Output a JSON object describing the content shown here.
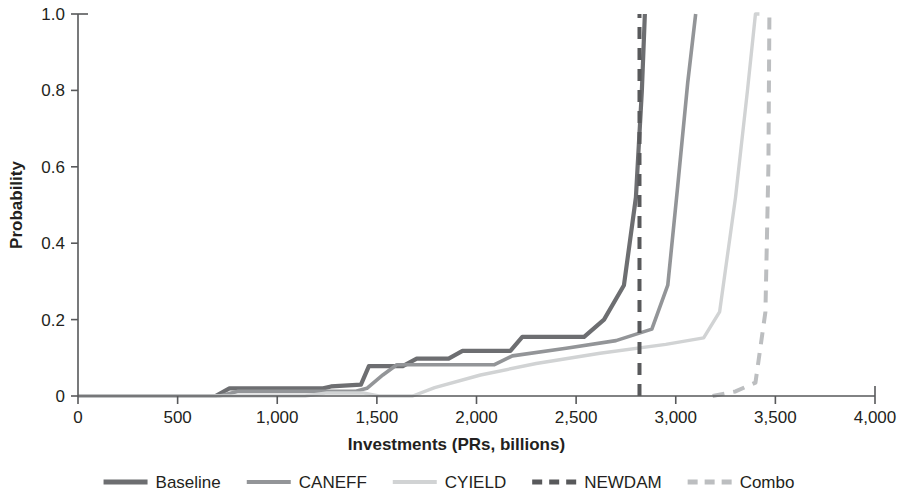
{
  "chart_data": {
    "type": "line",
    "title": "",
    "xlabel": "Investments (PRs, billions)",
    "ylabel": "Probability",
    "xlim": [
      0,
      4000
    ],
    "ylim": [
      0,
      1.0
    ],
    "grid": false,
    "legend_position": "bottom",
    "x_ticks": [
      0,
      500,
      1000,
      1500,
      2000,
      2500,
      3000,
      3500,
      4000
    ],
    "x_tick_labels": [
      "0",
      "500",
      "1,000",
      "1,500",
      "2,000",
      "2,500",
      "3,000",
      "3,500",
      "4,000"
    ],
    "y_ticks": [
      0,
      0.2,
      0.4,
      0.6,
      0.8,
      1.0
    ],
    "y_tick_labels": [
      "0",
      "0.2",
      "0.4",
      "0.6",
      "0.8",
      "1.0"
    ],
    "series": [
      {
        "name": "Baseline",
        "color": "#6d6e71",
        "width": 4.2,
        "dash": "none",
        "points": [
          [
            0,
            0.0
          ],
          [
            690,
            0.0
          ],
          [
            760,
            0.02
          ],
          [
            1230,
            0.02
          ],
          [
            1270,
            0.025
          ],
          [
            1420,
            0.03
          ],
          [
            1460,
            0.078
          ],
          [
            1630,
            0.078
          ],
          [
            1700,
            0.098
          ],
          [
            1860,
            0.098
          ],
          [
            1930,
            0.118
          ],
          [
            2170,
            0.118
          ],
          [
            2230,
            0.155
          ],
          [
            2540,
            0.155
          ],
          [
            2640,
            0.2
          ],
          [
            2740,
            0.29
          ],
          [
            2800,
            0.52
          ],
          [
            2830,
            0.8
          ],
          [
            2845,
            1.0
          ]
        ]
      },
      {
        "name": "CANEFF",
        "color": "#939598",
        "width": 3.6,
        "dash": "none",
        "points": [
          [
            0,
            0.0
          ],
          [
            710,
            0.0
          ],
          [
            800,
            0.012
          ],
          [
            1390,
            0.012
          ],
          [
            1450,
            0.02
          ],
          [
            1530,
            0.055
          ],
          [
            1600,
            0.082
          ],
          [
            2090,
            0.082
          ],
          [
            2180,
            0.105
          ],
          [
            2450,
            0.125
          ],
          [
            2700,
            0.145
          ],
          [
            2880,
            0.175
          ],
          [
            2960,
            0.29
          ],
          [
            3010,
            0.55
          ],
          [
            3060,
            0.82
          ],
          [
            3100,
            1.0
          ]
        ]
      },
      {
        "name": "CYIELD",
        "color": "#d1d3d4",
        "width": 3.4,
        "dash": "none",
        "points": [
          [
            0,
            0.0
          ],
          [
            1140,
            0.0
          ],
          [
            1250,
            0.008
          ],
          [
            1430,
            0.008
          ],
          [
            1510,
            0.0
          ],
          [
            1680,
            0.0
          ],
          [
            1790,
            0.022
          ],
          [
            2020,
            0.055
          ],
          [
            2300,
            0.085
          ],
          [
            2620,
            0.112
          ],
          [
            2950,
            0.135
          ],
          [
            3140,
            0.152
          ],
          [
            3220,
            0.22
          ],
          [
            3300,
            0.52
          ],
          [
            3360,
            0.8
          ],
          [
            3400,
            1.0
          ],
          [
            3420,
            1.0
          ]
        ]
      },
      {
        "name": "NEWDAM",
        "color": "#58595b",
        "width": 4.0,
        "dash": "12,9",
        "points": [
          [
            2818,
            0.0
          ],
          [
            2818,
            1.0
          ]
        ]
      },
      {
        "name": "Combo",
        "color": "#bcbec0",
        "width": 4.0,
        "dash": "12,9",
        "points": [
          [
            3185,
            0.0
          ],
          [
            3300,
            0.012
          ],
          [
            3400,
            0.035
          ],
          [
            3450,
            0.22
          ],
          [
            3465,
            0.6
          ],
          [
            3470,
            1.0
          ]
        ]
      }
    ]
  },
  "legend": {
    "items": [
      {
        "label": "Baseline",
        "color": "#6d6e71",
        "dash": "none",
        "width": 5
      },
      {
        "label": "CANEFF",
        "color": "#939598",
        "dash": "none",
        "width": 4
      },
      {
        "label": "CYIELD",
        "color": "#d1d3d4",
        "dash": "none",
        "width": 4
      },
      {
        "label": "NEWDAM",
        "color": "#58595b",
        "dash": "10,7",
        "width": 5
      },
      {
        "label": "Combo",
        "color": "#bcbec0",
        "dash": "10,7",
        "width": 5
      }
    ]
  },
  "axes": {
    "x_title": "Investments (PRs, billions)",
    "y_title": "Probability"
  }
}
